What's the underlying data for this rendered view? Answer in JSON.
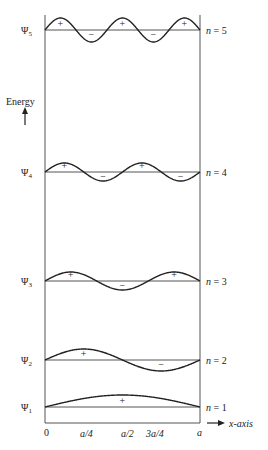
{
  "axis": {
    "y_label": "Energy",
    "x_label": "x-axis",
    "x_ticks": [
      "0",
      "a/4",
      "a/2",
      "3a/4",
      "a"
    ]
  },
  "levels": [
    {
      "n": 5,
      "psi_label": "Ψ5",
      "n_label": "n = 5",
      "signs": [
        "+",
        "−",
        "+",
        "−",
        "+"
      ]
    },
    {
      "n": 4,
      "psi_label": "Ψ4",
      "n_label": "n = 4",
      "signs": [
        "+",
        "−",
        "+",
        "−"
      ]
    },
    {
      "n": 3,
      "psi_label": "Ψ3",
      "n_label": "n = 3",
      "signs": [
        "+",
        "−",
        "+"
      ]
    },
    {
      "n": 2,
      "psi_label": "Ψ2",
      "n_label": "n = 2",
      "signs": [
        "+",
        "−"
      ]
    },
    {
      "n": 1,
      "psi_label": "Ψ1",
      "n_label": "n = 1",
      "signs": [
        "+"
      ]
    }
  ],
  "colors": {
    "line": "#222222",
    "axis": "#555555"
  }
}
